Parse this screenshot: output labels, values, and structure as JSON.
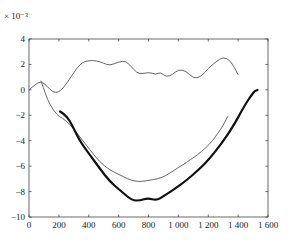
{
  "chart_data": {
    "type": "line",
    "title": "",
    "xlabel": "",
    "ylabel": "",
    "y_scale_note": "× 10⁻³",
    "xlim": [
      0,
      1600
    ],
    "ylim": [
      -10,
      4
    ],
    "grid": false,
    "legend": "none",
    "x_ticks": [
      0,
      200,
      400,
      600,
      800,
      1000,
      1200,
      1400,
      1600
    ],
    "x_tick_labels": [
      "0",
      "200",
      "400",
      "600",
      "800",
      "1 000",
      "1 200",
      "1 400",
      "1 600"
    ],
    "y_ticks": [
      4,
      2,
      0,
      -2,
      -4,
      -6,
      -8,
      -10
    ],
    "y_tick_labels": [
      "4",
      "2",
      "0",
      "−2",
      "−4",
      "−6",
      "−8",
      "−10"
    ],
    "series": [
      {
        "name": "upper-thin",
        "style": "thin",
        "color": "#555555",
        "x": [
          0,
          40,
          80,
          120,
          160,
          200,
          240,
          280,
          320,
          360,
          400,
          450,
          500,
          540,
          600,
          650,
          700,
          740,
          800,
          850,
          880,
          920,
          960,
          1000,
          1050,
          1100,
          1150,
          1200,
          1250,
          1300,
          1350,
          1400
        ],
        "y": [
          0,
          0.4,
          0.7,
          0.3,
          -0.2,
          -0.2,
          0.3,
          1.0,
          1.7,
          2.2,
          2.3,
          2.3,
          2.1,
          1.9,
          2.2,
          2.3,
          1.6,
          1.2,
          1.4,
          1.2,
          1.4,
          1.0,
          1.2,
          1.6,
          1.5,
          0.9,
          1.0,
          1.7,
          2.2,
          2.6,
          2.3,
          1.2
        ]
      },
      {
        "name": "lower-thin",
        "style": "thin",
        "color": "#555555",
        "x": [
          80,
          110,
          140,
          190,
          220,
          275,
          340,
          408,
          475,
          540,
          610,
          660,
          710,
          760,
          810,
          860,
          910,
          975,
          1030,
          1080,
          1130,
          1180,
          1230,
          1265,
          1300,
          1330
        ],
        "y": [
          0.7,
          -0.3,
          -1.2,
          -2.0,
          -2.2,
          -2.7,
          -3.7,
          -4.7,
          -5.7,
          -6.3,
          -6.7,
          -7.0,
          -7.2,
          -7.2,
          -7.1,
          -7.0,
          -6.8,
          -6.3,
          -5.9,
          -5.5,
          -5.1,
          -4.6,
          -4.0,
          -3.4,
          -2.8,
          -2.1
        ]
      },
      {
        "name": "bold",
        "style": "bold",
        "color": "#111111",
        "x": [
          208,
          255,
          290,
          330,
          375,
          420,
          475,
          540,
          620,
          690,
          745,
          795,
          855,
          910,
          975,
          1045,
          1145,
          1210,
          1290,
          1360,
          1445,
          1490,
          1510,
          1530
        ],
        "y": [
          -1.7,
          -2.1,
          -2.8,
          -3.8,
          -4.6,
          -5.3,
          -6.2,
          -7.2,
          -8.0,
          -8.7,
          -8.7,
          -8.5,
          -8.7,
          -8.3,
          -7.8,
          -7.2,
          -6.2,
          -5.4,
          -4.2,
          -3.0,
          -1.2,
          -0.4,
          -0.1,
          0.0
        ]
      }
    ]
  }
}
